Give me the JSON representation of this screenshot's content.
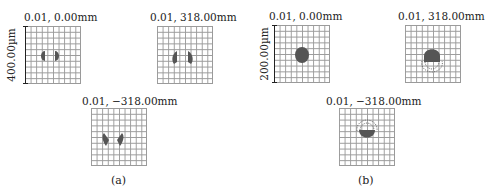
{
  "figure": {
    "panels": [
      {
        "id": "a",
        "caption": "(a)",
        "scale_label": "400.00µm",
        "subplots": [
          {
            "title": "0.01, 0.00mm",
            "position": "top-left",
            "shape": "two-lobes-symmetric"
          },
          {
            "title": "0.01, 318.00mm",
            "position": "top-right",
            "shape": "two-lobes-spread"
          },
          {
            "title": "0.01, −318.00mm",
            "position": "bottom-center",
            "shape": "two-lobes-tilted"
          }
        ]
      },
      {
        "id": "b",
        "caption": "(b)",
        "scale_label": "200.00µm",
        "subplots": [
          {
            "title": "0.01, 0.00mm",
            "position": "top-left",
            "shape": "single-round-spot"
          },
          {
            "title": "0.01, 318.00mm",
            "position": "top-right",
            "shape": "spot-with-lower-dashed-arcs"
          },
          {
            "title": "0.01, −318.00mm",
            "position": "bottom-center",
            "shape": "spot-with-upper-dashed-arcs"
          }
        ]
      }
    ]
  },
  "colors": {
    "spot": "#555555",
    "grid": "#9a9a9a",
    "text": "#222222"
  }
}
